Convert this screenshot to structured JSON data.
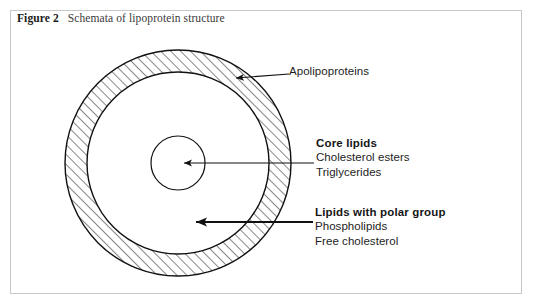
{
  "figure": {
    "caption_number": "Figure 2",
    "caption_text": "Schemata of lipoprotein structure",
    "border_color": "#c8c8c8",
    "background_color": "#ffffff",
    "stroke_color": "#111111"
  },
  "diagram": {
    "type": "concentric-circle-schematic",
    "center_x": 178,
    "center_y": 163,
    "outer_radius": 113,
    "shell_inner_radius": 91,
    "core_radius": 27,
    "hatch_angle_degrees": 45,
    "hatch_spacing": 7,
    "regions": [
      {
        "name": "outer-shell",
        "fill": "diagonal-hatch",
        "meaning": "Lipids with polar group / apolipoproteins layer"
      },
      {
        "name": "middle-ring",
        "fill": "none",
        "meaning": "clear annulus"
      },
      {
        "name": "core",
        "fill": "none",
        "meaning": "Core lipids"
      }
    ]
  },
  "annotations": {
    "apolipoproteins": {
      "title": "Apolipoproteins",
      "arrow": {
        "from_x": 289,
        "from_y": 74,
        "to_x": 234,
        "to_y": 78,
        "style": "thin-diagonal"
      }
    },
    "core_lipids": {
      "title": "Core lipids",
      "lines": [
        "Cholesterol esters",
        "Triglycerides"
      ],
      "arrow": {
        "from_x": 314,
        "from_y": 163,
        "to_x": 182,
        "to_y": 163,
        "style": "thin-horizontal"
      }
    },
    "polar_lipids": {
      "title": "Lipids with polar group",
      "lines": [
        "Phospholipids",
        "Free cholesterol"
      ],
      "arrow": {
        "from_x": 313,
        "from_y": 222,
        "to_x": 190,
        "to_y": 222,
        "style": "bold-horizontal"
      }
    }
  }
}
